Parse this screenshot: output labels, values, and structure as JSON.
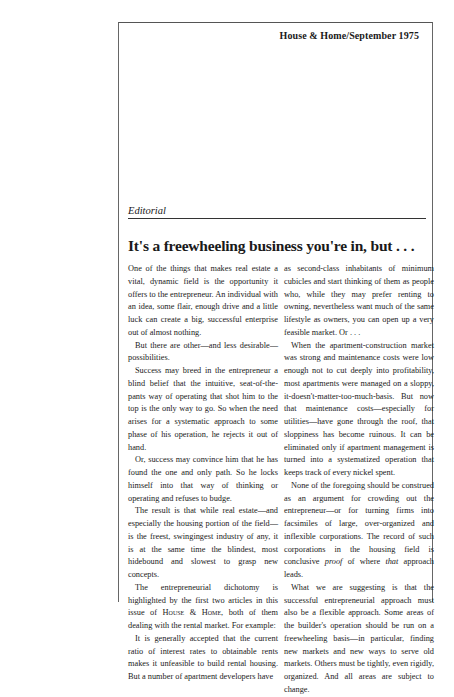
{
  "masthead": {
    "publication": "House & Home/September 1975"
  },
  "section": {
    "label": "Editorial"
  },
  "article": {
    "headline": "It's a freewheeling business you're in, but . . .",
    "left_column": [
      {
        "indent": false,
        "text": "One of the things that makes real estate a vital, dynamic field is the opportunity it offers to the entrepreneur. An individual with an idea, some flair, enough drive and a little luck can create a big, successful enterprise out of almost nothing."
      },
      {
        "indent": true,
        "text": "But there are other—and less desirable—possibilities."
      },
      {
        "indent": true,
        "text": "Success may breed in the entrepreneur a blind belief that the intuitive, seat-of-the-pants way of operating that shot him to the top is the only way to go. So when the need arises for a systematic approach to some phase of his operation, he rejects it out of hand."
      },
      {
        "indent": true,
        "text": "Or, success may convince him that he has found the one and only path. So he locks himself into that way of thinking or operating and refuses to budge."
      },
      {
        "indent": true,
        "text": "The result is that while real estate—and especially the housing portion of the field—is the freest, swingingest industry of any, it is at the same time the blindest, most hidebound and slowest to grasp new concepts."
      },
      {
        "indent": true,
        "text_before": "The entrepreneurial dichotomy is highlighted by the first two articles in this issue of ",
        "small_caps": "House & Home",
        "text_after": ", both of them dealing with the rental market. For example:"
      },
      {
        "indent": true,
        "text": "It is generally accepted that the current ratio of interest rates to obtainable rents makes it unfeasible to build rental housing. But a number of apartment developers have"
      }
    ],
    "right_column": [
      {
        "indent": false,
        "text": "as second-class inhabitants of minimum cubicles and start thinking of them as people who, while they may prefer renting to owning, nevertheless want much of the same lifestyle as owners, you can open up a very feasible market.  Or . . ."
      },
      {
        "indent": true,
        "text": "When the apartment-construction market was strong and maintenance costs were low enough not to cut deeply into profitability, most apartments were managed on a sloppy, it-doesn't-matter-too-much-basis. But now that maintenance costs—especially for utilities—have gone through the roof, that sloppiness has become ruinous. It can be eliminated only if apartment management is turned into a systematized operation that keeps track of every nickel spent."
      },
      {
        "indent": true,
        "text_before": "None of the foregoing should be construed as an argument for crowding out the entrepreneur—or for turning firms into facsimiles of large, over-organized and inflexible corporations. The record of such corporations in the housing field is conclusive ",
        "italic_1": "proof",
        "text_middle": " of where ",
        "italic_2": "that",
        "text_after": " approach leads."
      },
      {
        "indent": true,
        "text": "What we are suggesting is that the successful entrepreneurial approach must also be a flexible approach. Some areas of the builder's operation should be run on a freewheeling basis—in particular, finding new markets and new ways to serve old markets. Others must be tightly, even rigidly, organized. And all areas are subject to change."
      }
    ]
  }
}
